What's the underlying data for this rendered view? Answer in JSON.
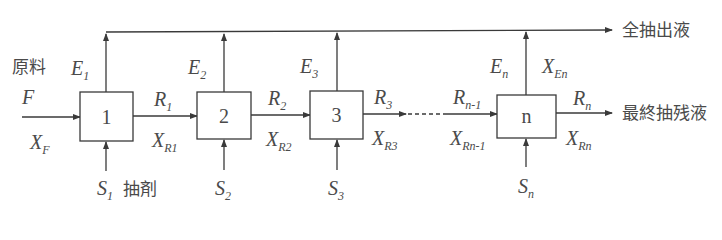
{
  "diagram": {
    "top_output_label": "全抽出液",
    "right_output_label": "最終抽残液",
    "feed": {
      "name_label": "原料",
      "symbol": "F",
      "composition": "X",
      "composition_sub": "F"
    },
    "solvent_label": "抽剤",
    "stages": [
      {
        "id": "1",
        "extract": "E",
        "extract_sub": "1",
        "raffinate": "R",
        "raffinate_sub": "1",
        "raffinate_x": "X",
        "raffinate_x_sub": "R1",
        "solvent": "S",
        "solvent_sub": "1"
      },
      {
        "id": "2",
        "extract": "E",
        "extract_sub": "2",
        "raffinate": "R",
        "raffinate_sub": "2",
        "raffinate_x": "X",
        "raffinate_x_sub": "R2",
        "solvent": "S",
        "solvent_sub": "2"
      },
      {
        "id": "3",
        "extract": "E",
        "extract_sub": "3",
        "raffinate": "R",
        "raffinate_sub": "3",
        "raffinate_x": "X",
        "raffinate_x_sub": "R3",
        "solvent": "S",
        "solvent_sub": "3"
      },
      {
        "id": "n",
        "extract": "E",
        "extract_sub": "n",
        "extract_x": "X",
        "extract_x_sub": "En",
        "raffinate": "R",
        "raffinate_sub": "n",
        "raffinate_x": "X",
        "raffinate_x_sub": "Rn",
        "solvent": "S",
        "solvent_sub": "n"
      }
    ],
    "intermediate": {
      "raffinate": "R",
      "raffinate_sub": "n-1",
      "raffinate_x": "X",
      "raffinate_x_sub": "Rn-1"
    },
    "colors": {
      "line": "#3a3a3a",
      "text": "#4a4a4a",
      "background": "#ffffff"
    }
  }
}
